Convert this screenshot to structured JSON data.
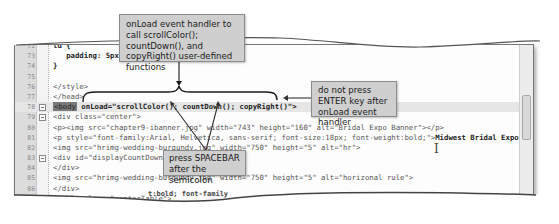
{
  "editor": {
    "lines": [
      {
        "n": "72",
        "text": "td {"
      },
      {
        "n": "73",
        "text": "   padding: 5px;"
      },
      {
        "n": "74",
        "text": "}"
      },
      {
        "n": "75",
        "text": ""
      },
      {
        "n": "76",
        "text": "</style>"
      },
      {
        "n": "77",
        "text": "</head>"
      },
      {
        "n": "78",
        "tag": "<body",
        "text": " onLoad=\"scrollColor(); countDown(); copyRight()\">"
      },
      {
        "n": "79",
        "text": "<div class=\"center\">"
      },
      {
        "n": "80",
        "text": "<p><img src=\"chapter9-ibanner.jpg\" width=\"743\" height=\"160\" alt=\"Bridal Expo Banner\"></p>"
      },
      {
        "n": "81",
        "text": "<p style=\"font-family:Arial, Helvetica, sans-serif; font-size:18px; font-weight:bold;\">",
        "bold": "Midwest Bridal Expo",
        "tail": "</p>"
      },
      {
        "n": "82",
        "text": "<img src=\"hrimg-wedding-burgundy.jpg\" width=\"750\" height=\"5\" alt=\"hr\">"
      },
      {
        "n": "83",
        "text": "<div id=\"displayCountDown\">"
      },
      {
        "n": "84",
        "text": "</div>"
      },
      {
        "n": "85",
        "text": "<img src=\"hrimg-wedding-burgundy.jpg\" width=\"750\" height=\"5\" alt=\"horizonal rule\">"
      },
      {
        "n": "86",
        "text": "</div>"
      },
      {
        "n": "87",
        "text": "<table class=\"centerTable\">"
      },
      {
        "n": "88",
        "text": "  <tr>"
      },
      {
        "n": "89",
        "text": "    <td colspan=\"3\">"
      }
    ],
    "bottom_fragment": "t:bold; font-family"
  },
  "callouts": {
    "onload": "onLoad event handler to call scrollColor(); countDown(), and copyRight() user-defined functions",
    "enter": "do not press ENTER key after onLoad event handler",
    "spacebar": "press SPACEBAR after the semicolon"
  },
  "cursor": "I"
}
